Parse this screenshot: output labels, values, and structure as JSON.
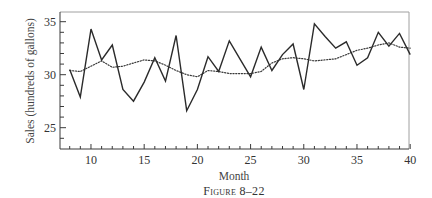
{
  "figure": {
    "caption": "Figure 8–22"
  },
  "chart_data": {
    "type": "line",
    "title": "",
    "caption": "Figure 8–22",
    "xlabel": "Month",
    "ylabel": "Sales (hundreds of gallons)",
    "xlim": [
      7,
      40
    ],
    "ylim": [
      23,
      36
    ],
    "x_ticks": [
      10,
      15,
      20,
      25,
      30,
      35,
      40
    ],
    "y_ticks": [
      25,
      30,
      35
    ],
    "grid": false,
    "legend": null,
    "x": [
      8,
      9,
      10,
      11,
      12,
      13,
      14,
      15,
      16,
      17,
      18,
      19,
      20,
      21,
      22,
      23,
      24,
      25,
      26,
      27,
      28,
      29,
      30,
      31,
      32,
      33,
      34,
      35,
      36,
      37,
      38,
      39,
      40
    ],
    "series": [
      {
        "name": "Actual sales",
        "style": "solid",
        "values": [
          30.5,
          27.9,
          34.3,
          31.4,
          32.8,
          28.6,
          27.5,
          29.3,
          31.6,
          29.4,
          33.7,
          26.6,
          28.6,
          31.7,
          30.3,
          33.2,
          31.5,
          29.8,
          32.6,
          30.4,
          31.9,
          32.9,
          28.6,
          34.8,
          33.6,
          32.5,
          33.1,
          30.9,
          31.6,
          34.0,
          32.7,
          33.9,
          31.9
        ]
      },
      {
        "name": "Smoothed / forecast",
        "style": "dotted",
        "values": [
          30.4,
          30.3,
          30.8,
          31.3,
          30.7,
          30.8,
          31.1,
          31.4,
          31.3,
          30.9,
          30.4,
          30.0,
          29.8,
          30.4,
          30.3,
          30.1,
          30.1,
          30.1,
          30.3,
          31.1,
          31.5,
          31.6,
          31.5,
          31.3,
          31.4,
          31.5,
          31.9,
          32.3,
          32.5,
          32.8,
          33.0,
          32.6,
          32.5
        ]
      }
    ]
  },
  "colors": {
    "line": "#2b2b2b",
    "axis": "#3a3a3a",
    "frame_light": "#9a9a9a"
  }
}
